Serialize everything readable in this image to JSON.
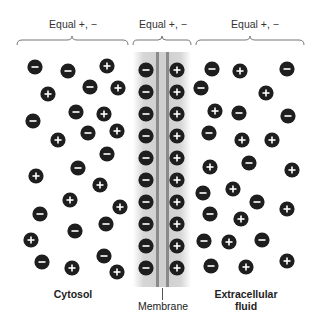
{
  "header": {
    "left_label": "Equal +, −",
    "center_label": "Equal +, −",
    "right_label": "Equal +, −"
  },
  "labels": {
    "cytosol": "Cytosol",
    "membrane": "Membrane",
    "extracellular": "Extracellular fluid"
  },
  "colors": {
    "ion_fill": "#1e1e1e",
    "ion_sign": "#ffffff",
    "membrane_band": "#d2d2d2",
    "membrane_line": "#8a8a8a"
  },
  "ions": {
    "cytosol": [
      {
        "x": 35,
        "y": 67,
        "sign": "-"
      },
      {
        "x": 68,
        "y": 71,
        "sign": "-"
      },
      {
        "x": 107,
        "y": 66,
        "sign": "+"
      },
      {
        "x": 48,
        "y": 94,
        "sign": "+"
      },
      {
        "x": 90,
        "y": 87,
        "sign": "-"
      },
      {
        "x": 118,
        "y": 88,
        "sign": "+"
      },
      {
        "x": 33,
        "y": 121,
        "sign": "-"
      },
      {
        "x": 76,
        "y": 112,
        "sign": "-"
      },
      {
        "x": 104,
        "y": 114,
        "sign": "+"
      },
      {
        "x": 88,
        "y": 133,
        "sign": "-"
      },
      {
        "x": 117,
        "y": 131,
        "sign": "+"
      },
      {
        "x": 58,
        "y": 140,
        "sign": "+"
      },
      {
        "x": 107,
        "y": 154,
        "sign": "-"
      },
      {
        "x": 78,
        "y": 168,
        "sign": "-"
      },
      {
        "x": 36,
        "y": 176,
        "sign": "+"
      },
      {
        "x": 100,
        "y": 185,
        "sign": "+"
      },
      {
        "x": 70,
        "y": 200,
        "sign": "+"
      },
      {
        "x": 120,
        "y": 207,
        "sign": "+"
      },
      {
        "x": 40,
        "y": 214,
        "sign": "-"
      },
      {
        "x": 106,
        "y": 224,
        "sign": "-"
      },
      {
        "x": 75,
        "y": 231,
        "sign": "-"
      },
      {
        "x": 31,
        "y": 240,
        "sign": "+"
      },
      {
        "x": 104,
        "y": 256,
        "sign": "-"
      },
      {
        "x": 42,
        "y": 262,
        "sign": "-"
      },
      {
        "x": 72,
        "y": 268,
        "sign": "+"
      },
      {
        "x": 117,
        "y": 272,
        "sign": "+"
      }
    ],
    "membrane_inner": [
      {
        "x": 146,
        "y": 70,
        "sign": "-"
      },
      {
        "x": 146,
        "y": 92,
        "sign": "-"
      },
      {
        "x": 146,
        "y": 114,
        "sign": "-"
      },
      {
        "x": 146,
        "y": 136,
        "sign": "-"
      },
      {
        "x": 146,
        "y": 158,
        "sign": "-"
      },
      {
        "x": 146,
        "y": 180,
        "sign": "-"
      },
      {
        "x": 146,
        "y": 202,
        "sign": "-"
      },
      {
        "x": 146,
        "y": 224,
        "sign": "-"
      },
      {
        "x": 146,
        "y": 246,
        "sign": "-"
      },
      {
        "x": 146,
        "y": 268,
        "sign": "-"
      }
    ],
    "membrane_outer": [
      {
        "x": 177,
        "y": 70,
        "sign": "+"
      },
      {
        "x": 177,
        "y": 92,
        "sign": "+"
      },
      {
        "x": 177,
        "y": 114,
        "sign": "+"
      },
      {
        "x": 177,
        "y": 136,
        "sign": "+"
      },
      {
        "x": 177,
        "y": 158,
        "sign": "+"
      },
      {
        "x": 177,
        "y": 180,
        "sign": "+"
      },
      {
        "x": 177,
        "y": 202,
        "sign": "+"
      },
      {
        "x": 177,
        "y": 224,
        "sign": "+"
      },
      {
        "x": 177,
        "y": 246,
        "sign": "+"
      },
      {
        "x": 177,
        "y": 268,
        "sign": "+"
      }
    ],
    "extracellular": [
      {
        "x": 212,
        "y": 69,
        "sign": "-"
      },
      {
        "x": 240,
        "y": 71,
        "sign": "+"
      },
      {
        "x": 287,
        "y": 69,
        "sign": "-"
      },
      {
        "x": 201,
        "y": 88,
        "sign": "-"
      },
      {
        "x": 266,
        "y": 93,
        "sign": "+"
      },
      {
        "x": 215,
        "y": 111,
        "sign": "+"
      },
      {
        "x": 239,
        "y": 113,
        "sign": "-"
      },
      {
        "x": 288,
        "y": 116,
        "sign": "-"
      },
      {
        "x": 209,
        "y": 133,
        "sign": "-"
      },
      {
        "x": 242,
        "y": 140,
        "sign": "+"
      },
      {
        "x": 272,
        "y": 140,
        "sign": "+"
      },
      {
        "x": 210,
        "y": 167,
        "sign": "+"
      },
      {
        "x": 249,
        "y": 163,
        "sign": "-"
      },
      {
        "x": 292,
        "y": 170,
        "sign": "+"
      },
      {
        "x": 203,
        "y": 193,
        "sign": "-"
      },
      {
        "x": 233,
        "y": 189,
        "sign": "+"
      },
      {
        "x": 257,
        "y": 202,
        "sign": "-"
      },
      {
        "x": 287,
        "y": 209,
        "sign": "+"
      },
      {
        "x": 210,
        "y": 214,
        "sign": "-"
      },
      {
        "x": 241,
        "y": 219,
        "sign": "+"
      },
      {
        "x": 204,
        "y": 241,
        "sign": "-"
      },
      {
        "x": 229,
        "y": 242,
        "sign": "+"
      },
      {
        "x": 262,
        "y": 240,
        "sign": "-"
      },
      {
        "x": 211,
        "y": 266,
        "sign": "-"
      },
      {
        "x": 246,
        "y": 267,
        "sign": "+"
      },
      {
        "x": 287,
        "y": 261,
        "sign": "+"
      }
    ]
  }
}
